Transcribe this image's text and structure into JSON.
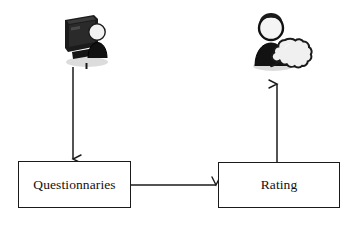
{
  "diagram": {
    "type": "flow-diagram",
    "background_color": "#ffffff",
    "line_color": "#1a1a1a",
    "nodes": [
      {
        "id": "questionnaries",
        "label": "Questionnaries",
        "shape": "rectangle",
        "x": 18,
        "y": 161,
        "width": 113,
        "height": 47
      },
      {
        "id": "rating",
        "label": "Rating",
        "shape": "rectangle",
        "x": 218,
        "y": 162,
        "width": 122,
        "height": 46
      }
    ],
    "icons": [
      {
        "id": "user-computer",
        "name": "user-at-computer-icon",
        "description": "person standing beside a dark computer monitor",
        "x": 58,
        "y": 8,
        "width": 56,
        "height": 62
      },
      {
        "id": "user-comment",
        "name": "user-with-speech-bubble-icon",
        "description": "person with a speech bubble",
        "x": 245,
        "y": 10,
        "width": 68,
        "height": 64
      }
    ],
    "arrows": [
      {
        "id": "arrow-user-to-questionnaries",
        "from": "user-computer",
        "to": "questionnaries",
        "direction": "down",
        "x1": 73,
        "y1": 67,
        "x2": 73,
        "y2": 160
      },
      {
        "id": "arrow-questionnaries-to-rating",
        "from": "questionnaries",
        "to": "rating",
        "direction": "right",
        "x1": 131,
        "y1": 185,
        "x2": 217,
        "y2": 185
      },
      {
        "id": "arrow-rating-to-user",
        "from": "rating",
        "to": "user-comment",
        "direction": "up",
        "x1": 277,
        "y1": 162,
        "x2": 277,
        "y2": 83
      }
    ]
  }
}
